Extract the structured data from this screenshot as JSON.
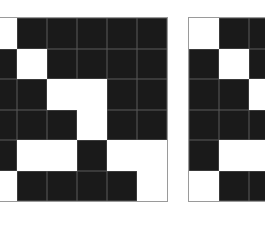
{
  "diagram": {
    "type": "binary-matrix-pair",
    "colors": {
      "filled": "#1a1a1a",
      "empty": "#ffffff",
      "border": "#9a9a9a"
    },
    "left_matrix": {
      "rows": 6,
      "visible_cols": 6,
      "cells": [
        [
          0,
          1,
          1,
          1,
          1,
          1
        ],
        [
          1,
          0,
          1,
          1,
          1,
          1
        ],
        [
          1,
          1,
          0,
          0,
          1,
          1
        ],
        [
          1,
          1,
          1,
          0,
          1,
          1
        ],
        [
          1,
          0,
          0,
          1,
          0,
          0
        ],
        [
          0,
          1,
          1,
          1,
          1,
          0
        ]
      ]
    },
    "right_matrix": {
      "rows": 6,
      "visible_cols": 3,
      "cells": [
        [
          0,
          1,
          1
        ],
        [
          1,
          0,
          1
        ],
        [
          1,
          1,
          0
        ],
        [
          1,
          1,
          1
        ],
        [
          1,
          0,
          0
        ],
        [
          0,
          1,
          1
        ]
      ]
    }
  }
}
